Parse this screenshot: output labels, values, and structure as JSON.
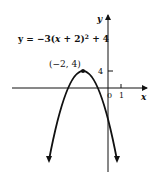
{
  "diagram": {
    "equation": "y = −3(x + 2)² + 4",
    "equation_parts": {
      "lhs": "y = −3(",
      "x": "x",
      "mid": " + 2)",
      "exp": "2",
      "tail": " + 4"
    },
    "vertex_label": "(−2, 4)",
    "axis_labels": {
      "x": "x",
      "y": "y"
    },
    "tick_labels": {
      "origin": "0",
      "x_one": "1",
      "y_four": "4"
    },
    "colors": {
      "ink": "#111111",
      "background": "#ffffff"
    }
  }
}
